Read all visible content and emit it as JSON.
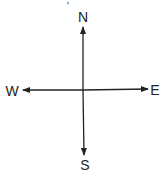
{
  "diagram": {
    "type": "compass",
    "labels": {
      "north": "N",
      "south": "S",
      "east": "E",
      "west": "W"
    },
    "stray_mark": "'",
    "colors": {
      "line": "#222222",
      "background": "#ffffff"
    }
  }
}
